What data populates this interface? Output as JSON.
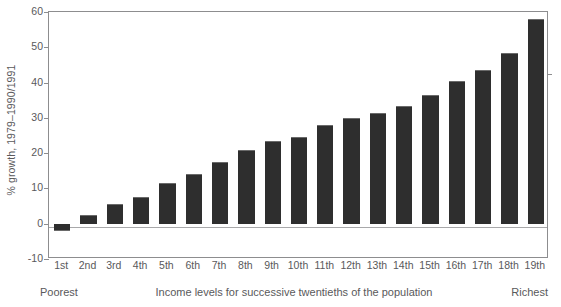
{
  "chart_data": {
    "type": "bar",
    "title": "",
    "xlabel": "Income levels for successive twentieths of the population",
    "ylabel": "% growth, 1979–1990/1991",
    "categories": [
      "1st",
      "2nd",
      "3rd",
      "4th",
      "5th",
      "6th",
      "7th",
      "8th",
      "9th",
      "10th",
      "11th",
      "12th",
      "13th",
      "14th",
      "15th",
      "16th",
      "17th",
      "18th",
      "19th"
    ],
    "values": [
      -2,
      2.5,
      5.5,
      7.5,
      11.5,
      14,
      17.5,
      21,
      23.5,
      24.5,
      28,
      30,
      31.5,
      33.5,
      36.5,
      40.5,
      43.5,
      48.5,
      58
    ],
    "ylim": [
      -10,
      60
    ],
    "yticks": [
      -10,
      0,
      10,
      20,
      30,
      40,
      50,
      60
    ],
    "ytick_labels": [
      "-10",
      "0",
      "10",
      "20",
      "30",
      "40",
      "50",
      "60"
    ],
    "grid": false,
    "legend": null,
    "bar_color": "#2e2e2e",
    "axis_color": "#8d8d8f",
    "text_color": "#59595b"
  },
  "caption": {
    "left": "Poorest",
    "middle": "Income levels for successive twentieths of the population",
    "right": "Richest"
  }
}
